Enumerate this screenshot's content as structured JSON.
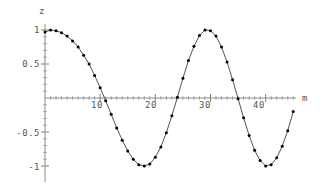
{
  "chart_data": {
    "type": "line",
    "title": "",
    "xlabel": "m",
    "ylabel": "z",
    "xlim": [
      0,
      45.5
    ],
    "ylim": [
      -1.08,
      1.08
    ],
    "grid": false,
    "legend": null,
    "markers": "filled-circle",
    "line_color": "#3a3a3a",
    "marker_color": "#000000",
    "axis_color": "#808080",
    "xticks": [
      {
        "value": 10,
        "label": "10"
      },
      {
        "value": 20,
        "label": "20"
      },
      {
        "value": 30,
        "label": "30"
      },
      {
        "value": 40,
        "label": "40"
      }
    ],
    "xminor": [
      1,
      2,
      3,
      4,
      5,
      6,
      7,
      8,
      9,
      11,
      12,
      13,
      14,
      15,
      16,
      17,
      18,
      19,
      21,
      22,
      23,
      24,
      25,
      26,
      27,
      28,
      29,
      31,
      32,
      33,
      34,
      35,
      36,
      37,
      38,
      39,
      41,
      42,
      43,
      44,
      45
    ],
    "yticks": [
      {
        "value": 1,
        "label": "1"
      },
      {
        "value": 0.5,
        "label": "0.5"
      },
      {
        "value": -0.5,
        "label": "-0.5"
      },
      {
        "value": -1,
        "label": "-1"
      }
    ],
    "yminor": [
      0.9,
      0.8,
      0.7,
      0.6,
      0.4,
      0.3,
      0.2,
      0.1,
      -0.1,
      -0.2,
      -0.3,
      -0.4,
      -0.6,
      -0.7,
      -0.8,
      -0.9
    ],
    "x": [
      0,
      1,
      2,
      3,
      4,
      5,
      6,
      7,
      8,
      9,
      10,
      11,
      12,
      13,
      14,
      15,
      16,
      17,
      18,
      19,
      20,
      21,
      22,
      23,
      24,
      25,
      26,
      27,
      28,
      29,
      30,
      31,
      32,
      33,
      34,
      35,
      36,
      37,
      38,
      39,
      40,
      41,
      42,
      43,
      44,
      45
    ],
    "y": [
      1.0,
      0.99,
      0.96,
      0.91,
      0.84,
      0.74,
      0.62,
      0.48,
      0.33,
      0.17,
      0.0,
      -0.17,
      -0.37,
      -0.55,
      -0.72,
      -0.87,
      -0.97,
      -1.0,
      -0.94,
      -0.78,
      -0.51,
      -0.17,
      0.22,
      0.59,
      0.87,
      1.0,
      0.94,
      0.72,
      0.36,
      -0.07,
      -0.49,
      -0.82,
      -0.99,
      -0.96,
      -0.73,
      -0.35,
      0.11,
      0.54,
      0.86,
      1.0,
      0.92,
      0.65,
      0.24,
      -0.22,
      -0.63,
      -0.9
    ],
    "y_render": [
      0.97,
      1.0,
      0.99,
      0.96,
      0.91,
      0.84,
      0.75,
      0.63,
      0.5,
      0.33,
      0.15,
      -0.04,
      -0.24,
      -0.44,
      -0.62,
      -0.78,
      -0.9,
      -0.98,
      -1.0,
      -0.97,
      -0.87,
      -0.72,
      -0.51,
      -0.26,
      0.01,
      0.29,
      0.55,
      0.76,
      0.92,
      1.0,
      0.99,
      0.91,
      0.75,
      0.53,
      0.27,
      -0.01,
      -0.29,
      -0.55,
      -0.77,
      -0.92,
      -1.0,
      -0.98,
      -0.88,
      -0.71,
      -0.48,
      -0.2
    ],
    "note": "aliased cosine sampled at integer m showing beat/moire pattern"
  },
  "labels": {
    "y_axis_title": "z",
    "x_axis_title": "m",
    "y_tick_1": "1",
    "y_tick_05": "0.5",
    "y_tick_m05": "-0.5",
    "y_tick_m1": "-1",
    "x_tick_10": "10",
    "x_tick_20": "20",
    "x_tick_30": "30",
    "x_tick_40": "40"
  },
  "colors": {
    "background": "#ffffff",
    "axis": "#8c8c8c",
    "curve": "#3f3f3f",
    "marker": "#111111",
    "text": "#555555"
  }
}
